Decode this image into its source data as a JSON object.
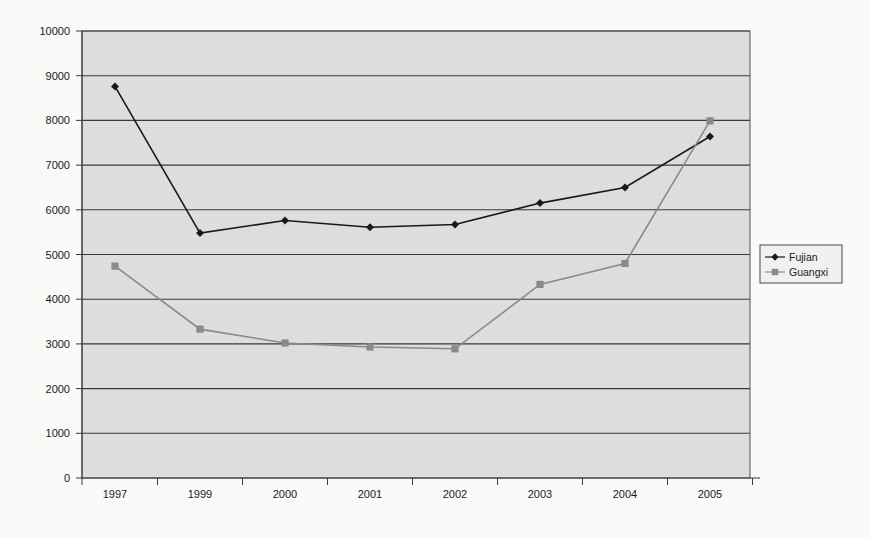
{
  "chart_data": {
    "type": "line",
    "title": "",
    "subtitle": "",
    "xlabel": "",
    "ylabel": "",
    "categories": [
      "1997",
      "1999",
      "2000",
      "2001",
      "2002",
      "2003",
      "2004",
      "2005"
    ],
    "series": [
      {
        "name": "Fujian",
        "color": "#1a1a1a",
        "marker": "diamond",
        "values": [
          8760,
          5480,
          5760,
          5610,
          5670,
          6150,
          6500,
          7640
        ]
      },
      {
        "name": "Guangxi",
        "color": "#8c8c8c",
        "marker": "square",
        "values": [
          4740,
          3330,
          3020,
          2930,
          2890,
          4330,
          4800,
          7990
        ]
      }
    ],
    "ylim": [
      0,
      10000
    ],
    "ytick_step": 1000,
    "yticks": [
      "0",
      "1000",
      "2000",
      "3000",
      "4000",
      "5000",
      "6000",
      "7000",
      "8000",
      "9000",
      "10000"
    ],
    "grid": true,
    "grid_orientation": "horizontal",
    "legend_position": "right",
    "plot_background": "#dcdcdc",
    "gridline_color": "#3a3a3a"
  },
  "legend": {
    "entries": [
      {
        "label": "Fujian"
      },
      {
        "label": "Guangxi"
      }
    ]
  }
}
